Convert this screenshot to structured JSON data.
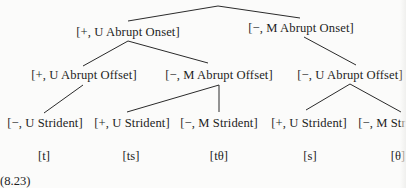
{
  "diagram": {
    "type": "feature-tree",
    "root": {
      "children": [
        {
          "label": "[+, U Abrupt Onset]",
          "children": [
            {
              "label": "[+, U Abrupt Offset]",
              "children": [
                {
                  "label": "[−, U Strident]",
                  "segment": "[t]"
                }
              ]
            },
            {
              "label": "[−, M Abrupt Offset]",
              "children": [
                {
                  "label": "[+, U Strident]",
                  "segment": "[ts]"
                },
                {
                  "label": "[−, M Strident]",
                  "segment": "[tθ]"
                }
              ]
            }
          ]
        },
        {
          "label": "[−, M Abrupt Onset]",
          "children": [
            {
              "label": "[−, U Abrupt Offset]",
              "children": [
                {
                  "label": "[+, U Strident]",
                  "segment": "[s]"
                },
                {
                  "label": "[−, M Strident]",
                  "segment": "[θ]"
                }
              ]
            }
          ]
        }
      ]
    },
    "level1": [
      {
        "label": "[+, U Abrupt Onset]"
      },
      {
        "label": "[−, M Abrupt Onset]"
      }
    ],
    "level2": [
      {
        "label": "[+, U Abrupt Offset]"
      },
      {
        "label": "[−, M Abrupt Offset]"
      },
      {
        "label": "[−, U Abrupt Offset]"
      }
    ],
    "level3": [
      {
        "label": "[−, U Strident]"
      },
      {
        "label": "[+, U Strident]"
      },
      {
        "label": "[−, M Strident]"
      },
      {
        "label": "[+, U Strident]"
      },
      {
        "label": "[−, M Str"
      }
    ],
    "segments": [
      {
        "label": "[t]"
      },
      {
        "label": "[ts]"
      },
      {
        "label": "[tθ]"
      },
      {
        "label": "[s]"
      },
      {
        "label": "[θ]"
      }
    ],
    "caption": "(8.23)"
  }
}
